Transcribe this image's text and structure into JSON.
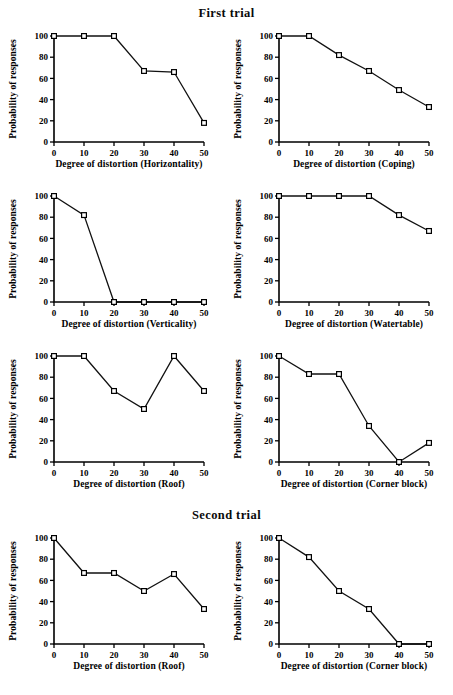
{
  "figure": {
    "section_titles": {
      "first": "First trial",
      "second": "Second trial"
    },
    "axis": {
      "ylabel": "Probability of responses",
      "yticks": [
        "0",
        "20",
        "40",
        "60",
        "80",
        "100"
      ],
      "xticks": [
        "0",
        "10",
        "20",
        "30",
        "40",
        "50"
      ]
    }
  },
  "chart_data": [
    {
      "type": "line",
      "panel": "first-trial-horizontality",
      "title": "",
      "xlabel": "Degree of distortion (Horizontality)",
      "ylabel": "Probability of responses",
      "x": [
        0,
        10,
        20,
        30,
        40,
        50
      ],
      "values": [
        100,
        100,
        100,
        67,
        66,
        18
      ],
      "xlim": [
        0,
        50
      ],
      "ylim": [
        0,
        100
      ],
      "grid": false,
      "legend": "none",
      "marker": "open-square"
    },
    {
      "type": "line",
      "panel": "first-trial-coping",
      "title": "",
      "xlabel": "Degree of distortion (Coping)",
      "ylabel": "Probability of responses",
      "x": [
        0,
        10,
        20,
        30,
        40,
        50
      ],
      "values": [
        100,
        100,
        82,
        67,
        49,
        33
      ],
      "xlim": [
        0,
        50
      ],
      "ylim": [
        0,
        100
      ],
      "grid": false,
      "legend": "none",
      "marker": "open-square"
    },
    {
      "type": "line",
      "panel": "first-trial-verticality",
      "title": "",
      "xlabel": "Degree of distortion (Verticality)",
      "ylabel": "Probability of responses",
      "x": [
        0,
        10,
        20,
        30,
        40,
        50
      ],
      "values": [
        100,
        82,
        0,
        0,
        0,
        0
      ],
      "xlim": [
        0,
        50
      ],
      "ylim": [
        0,
        100
      ],
      "grid": false,
      "legend": "none",
      "marker": "open-square"
    },
    {
      "type": "line",
      "panel": "first-trial-watertable",
      "title": "",
      "xlabel": "Degree of distortion (Watertable)",
      "ylabel": "Probability of responses",
      "x": [
        0,
        10,
        20,
        30,
        40,
        50
      ],
      "values": [
        100,
        100,
        100,
        100,
        82,
        67
      ],
      "xlim": [
        0,
        50
      ],
      "ylim": [
        0,
        100
      ],
      "grid": false,
      "legend": "none",
      "marker": "open-square"
    },
    {
      "type": "line",
      "panel": "first-trial-roof",
      "title": "",
      "xlabel": "Degree of distortion (Roof)",
      "ylabel": "Probability of responses",
      "x": [
        0,
        10,
        20,
        30,
        40,
        50
      ],
      "values": [
        100,
        100,
        67,
        50,
        100,
        67
      ],
      "xlim": [
        0,
        50
      ],
      "ylim": [
        0,
        100
      ],
      "grid": false,
      "legend": "none",
      "marker": "open-square"
    },
    {
      "type": "line",
      "panel": "first-trial-corner-block",
      "title": "",
      "xlabel": "Degree of distortion (Corner block)",
      "ylabel": "Probability of responses",
      "x": [
        0,
        10,
        20,
        30,
        40,
        50
      ],
      "values": [
        100,
        83,
        83,
        34,
        0,
        18
      ],
      "xlim": [
        0,
        50
      ],
      "ylim": [
        0,
        100
      ],
      "grid": false,
      "legend": "none",
      "marker": "open-square"
    },
    {
      "type": "line",
      "panel": "second-trial-roof",
      "title": "",
      "xlabel": "Degree of distortion (Roof)",
      "ylabel": "Probability of responses",
      "x": [
        0,
        10,
        20,
        30,
        40,
        50
      ],
      "values": [
        100,
        67,
        67,
        50,
        66,
        33
      ],
      "xlim": [
        0,
        50
      ],
      "ylim": [
        0,
        100
      ],
      "grid": false,
      "legend": "none",
      "marker": "open-square"
    },
    {
      "type": "line",
      "panel": "second-trial-corner-block",
      "title": "",
      "xlabel": "Degree of distortion (Corner block)",
      "ylabel": "Probability of responses",
      "x": [
        0,
        10,
        20,
        30,
        40,
        50
      ],
      "values": [
        100,
        82,
        50,
        33,
        0,
        0
      ],
      "xlim": [
        0,
        50
      ],
      "ylim": [
        0,
        100
      ],
      "grid": false,
      "legend": "none",
      "marker": "open-square"
    }
  ]
}
